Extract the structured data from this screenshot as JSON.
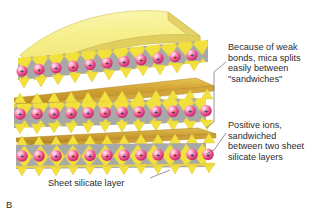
{
  "figure": {
    "panel_label": "B"
  },
  "annotations": [
    {
      "name": "weak-bonds-note",
      "text": "Because of weak\nbonds, mica splits\neasily between\n\"sandwiches\"",
      "lines": [
        "Because of weak",
        "bonds, mica splits",
        "easily between",
        "\"sandwiches\""
      ]
    },
    {
      "name": "positive-ions-note",
      "text": "Positive ions,\nsandwiched\nbetween two sheet\nsilicate layers",
      "lines": [
        "Positive ions,",
        "sandwiched",
        "between two sheet",
        "silicate layers"
      ]
    }
  ],
  "caption": {
    "sheet_silicate_layer": "Sheet silicate layer"
  },
  "legend_symbols": {
    "ion_charge": "+"
  },
  "colors": {
    "sheet_top_pale_yellow": "#F5EE8A",
    "sheet_bright_yellow": "#F2E03C",
    "sheet_edge_gold": "#C89A30",
    "sheet_shadow_gold": "#D9A93A",
    "octahedra_gray": "#A8A8A8",
    "ion_core_pink": "#FFC7DA",
    "ion_mid_pink": "#F04E8E",
    "ion_edge_magenta": "#C9246B",
    "ion_plus_black": "#1a1a1a",
    "text_dark": "#2b2b2b",
    "leader_line": "#6b6b6b",
    "background": "#FFFFFF"
  },
  "structure": {
    "sandwich_count": 3,
    "ions_per_row": 11,
    "tetrahedra_per_row": 12,
    "description": "Three sheet-silicate sandwiches stacked vertically, each with a row of positive ions between yellow tetrahedral sheets and gray octahedral diamonds; dark gold interlayer bands mark the weak-bond cleavage planes."
  }
}
